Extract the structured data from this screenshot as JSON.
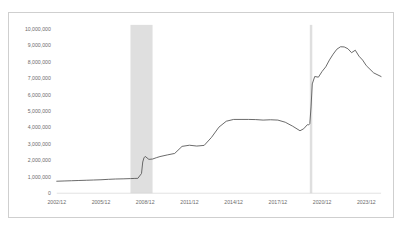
{
  "chart_data": {
    "type": "line",
    "title": "",
    "subtitle": "",
    "xlabel": "",
    "ylabel": "",
    "ylim": [
      0,
      10000000
    ],
    "yticks": [
      0,
      1000000,
      2000000,
      3000000,
      4000000,
      5000000,
      6000000,
      7000000,
      8000000,
      9000000,
      10000000
    ],
    "ytick_labels": [
      "0",
      "1,000,000",
      "2,000,000",
      "3,000,000",
      "4,000,000",
      "5,000,000",
      "6,000,000",
      "7,000,000",
      "8,000,000",
      "9,000,000",
      "10,000,000"
    ],
    "xtick_labels": [
      "2002/12",
      "2005/12",
      "2008/12",
      "2011/12",
      "2014/12",
      "2017/12",
      "2020/12",
      "2023/12"
    ],
    "xlim": [
      "2002/12",
      "2024/12"
    ],
    "grid": false,
    "legend": "none",
    "line_color": "#595959",
    "shaded_band_color": "#d9d9d9",
    "shaded_bands": [
      {
        "start": "2007/12",
        "end": "2009/06"
      },
      {
        "start": "2020/02",
        "end": "2020/04"
      }
    ],
    "series": [
      {
        "name": "Total Assets",
        "x": [
          "2002/12",
          "2003/06",
          "2003/12",
          "2004/06",
          "2004/12",
          "2005/06",
          "2005/12",
          "2006/06",
          "2006/12",
          "2007/06",
          "2007/12",
          "2008/03",
          "2008/06",
          "2008/09",
          "2008/10",
          "2008/11",
          "2008/12",
          "2009/03",
          "2009/06",
          "2009/09",
          "2009/12",
          "2010/06",
          "2010/12",
          "2011/06",
          "2011/12",
          "2012/06",
          "2012/12",
          "2013/06",
          "2013/12",
          "2014/06",
          "2014/12",
          "2015/06",
          "2015/12",
          "2016/06",
          "2016/12",
          "2017/06",
          "2017/12",
          "2018/06",
          "2018/12",
          "2019/06",
          "2019/09",
          "2019/12",
          "2020/01",
          "2020/02",
          "2020/03",
          "2020/04",
          "2020/06",
          "2020/09",
          "2020/12",
          "2021/03",
          "2021/06",
          "2021/09",
          "2021/12",
          "2022/03",
          "2022/06",
          "2022/09",
          "2022/12",
          "2023/03",
          "2023/06",
          "2023/09",
          "2023/12",
          "2024/06",
          "2024/12"
        ],
        "y": [
          730000,
          745000,
          760000,
          775000,
          790000,
          805000,
          820000,
          845000,
          865000,
          875000,
          890000,
          900000,
          905000,
          1200000,
          1900000,
          2150000,
          2240000,
          2060000,
          2080000,
          2160000,
          2230000,
          2330000,
          2420000,
          2850000,
          2920000,
          2870000,
          2910000,
          3400000,
          4020000,
          4380000,
          4490000,
          4490000,
          4490000,
          4480000,
          4450000,
          4470000,
          4450000,
          4320000,
          4080000,
          3800000,
          3920000,
          4170000,
          4150000,
          4240000,
          5250000,
          6650000,
          7100000,
          7060000,
          7410000,
          7690000,
          8110000,
          8460000,
          8760000,
          8910000,
          8900000,
          8790000,
          8550000,
          8700000,
          8340000,
          8100000,
          7760000,
          7320000,
          7100000
        ]
      }
    ]
  }
}
